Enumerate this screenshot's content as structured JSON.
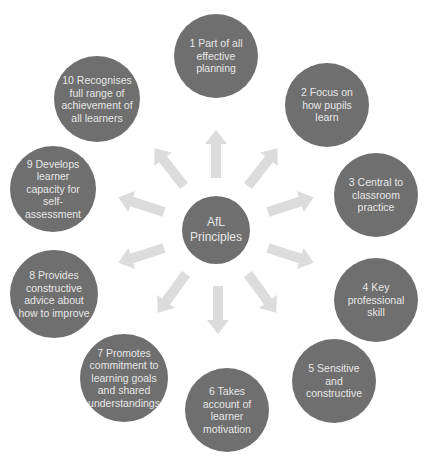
{
  "diagram": {
    "type": "radial-hub",
    "colors": {
      "node_fill": "#6f6f6f",
      "node_text": "#e6e6e6",
      "arrow_fill": "#dcdcdc",
      "background": "#ffffff"
    },
    "hub": {
      "label": "AfL Principles"
    },
    "nodes": [
      {
        "label": "1 Part of all effective planning"
      },
      {
        "label": "2 Focus on how pupils learn"
      },
      {
        "label": "3 Central to classroom practice"
      },
      {
        "label": "4 Key professional skill"
      },
      {
        "label": "5 Sensitive and constructive"
      },
      {
        "label": "6 Takes account of learner motivation"
      },
      {
        "label": "7 Promotes commitment to learning goals and shared understandings"
      },
      {
        "label": "8 Provides constructive advice about how to improve"
      },
      {
        "label": "9 Develops learner capacity for self-assessment"
      },
      {
        "label": "10 Recognises full range of achievement of all learners"
      }
    ],
    "edges": [
      {
        "from": "hub",
        "to": 1
      },
      {
        "from": "hub",
        "to": 2
      },
      {
        "from": "hub",
        "to": 3
      },
      {
        "from": "hub",
        "to": 4
      },
      {
        "from": "hub",
        "to": 5
      },
      {
        "from": "hub",
        "to": 6
      },
      {
        "from": "hub",
        "to": 7
      },
      {
        "from": "hub",
        "to": 8
      },
      {
        "from": "hub",
        "to": 9
      },
      {
        "from": "hub",
        "to": 10
      }
    ]
  }
}
